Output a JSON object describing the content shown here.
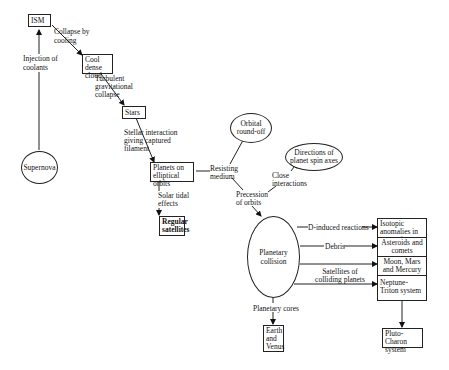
{
  "nodes": {
    "ism": "ISM",
    "supernova": "Supernova",
    "cool_dense_cloud": "Cool dense cloud",
    "stars": "Stars",
    "planets_elliptical": "Planets on elliptical orbits",
    "regular_satellites": "Regular satellites",
    "orbital_roundoff": "Orbital round-off",
    "spin_axes": "Directions of planet spin axes",
    "planetary_collision": "Planetary collision",
    "isotopic_anomalies": "Isotopic anomalies in meteorites",
    "asteroids_comets": "Asteroids and comets",
    "moon_mars_mercury": "Moon, Mars and Mercury",
    "neptune_triton": "Neptune-Triton system",
    "pluto_charon": "Pluto-Charon system",
    "earth_venus": "Earth and Venus"
  },
  "edges": {
    "injection_of_coolants": "Injection of coolants",
    "collapse_by_cooling": "Collapse by cooling",
    "turbulent_collapse": "Turbulent gravitational collapse",
    "stellar_interaction": "Stellar interaction giving captured filament",
    "solar_tidal": "Solar tidal effects",
    "resisting_medium": "Resisting medium",
    "precession": "Precession of orbits",
    "close_interactions": "Close interactions",
    "d_induced": "D-induced reactions",
    "debris": "Debris",
    "satellites_colliding": "Satellites of colliding planets",
    "planetary_cores": "Planetary cores"
  }
}
